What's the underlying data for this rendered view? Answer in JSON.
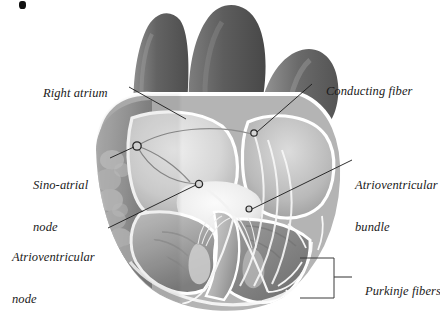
{
  "figure": {
    "kind": "anatomical-illustration",
    "style": "grayscale-shaded-drawing",
    "background": "#ffffff",
    "width": 440,
    "height": 322
  },
  "palette": {
    "background": "#ffffff",
    "vessel_dark": "#6e6e6e",
    "vessel_darker": "#5a5a5a",
    "myocardium_mid": "#9a9a9a",
    "myocardium_light": "#c3c3c3",
    "chamber_pale": "#e2e2e2",
    "valve_white": "#f4f4f4",
    "outline": "#ffffff",
    "leader_line": "#1a1a1a",
    "text": "#1a1a1a",
    "bracket": "#3a3a3a"
  },
  "labels": [
    {
      "id": "right-atrium",
      "text": "Right atrium",
      "lines": [
        "Right atrium"
      ],
      "x": 30,
      "y": 72,
      "align": "left",
      "leader": {
        "from": [
          129,
          87
        ],
        "to": [
          185,
          118
        ],
        "marker": "none"
      }
    },
    {
      "id": "sino-atrial-node",
      "text": "Sino-atrial node",
      "lines": [
        "Sino-atrial",
        "node"
      ],
      "x": 33,
      "y": 150,
      "align": "left",
      "leader": {
        "from": [
          110,
          158
        ],
        "to": [
          137,
          146
        ],
        "marker": "circle"
      }
    },
    {
      "id": "atrioventricular-node",
      "text": "Atrioventricular node",
      "lines": [
        "Atrioventricular",
        "node"
      ],
      "x": 12,
      "y": 222,
      "align": "left",
      "leader": {
        "from": [
          108,
          228
        ],
        "to": [
          199,
          184
        ],
        "marker": "circle"
      }
    },
    {
      "id": "conducting-fiber",
      "text": "Conducting fiber",
      "lines": [
        "Conducting fiber"
      ],
      "x": 313,
      "y": 70,
      "align": "left",
      "leader": {
        "from": [
          312,
          84
        ],
        "to": [
          254,
          133
        ],
        "marker": "circle"
      }
    },
    {
      "id": "atrioventricular-bundle",
      "text": "Atrioventricular bundle",
      "lines": [
        "Atrioventricular",
        "bundle"
      ],
      "x": 355,
      "y": 150,
      "align": "left",
      "leader": {
        "from": [
          352,
          160
        ],
        "to": [
          249,
          209
        ],
        "marker": "circle"
      }
    },
    {
      "id": "purkinje-fibers",
      "text": "Purkinje fibers",
      "lines": [
        "Purkinje fibers"
      ],
      "x": 352,
      "y": 270,
      "align": "left",
      "leader": {
        "from": [
          352,
          277
        ],
        "to": [
          334,
          277
        ],
        "marker": "none"
      },
      "bracket": {
        "x": 300,
        "y": 258,
        "width": 34,
        "height": 40
      }
    }
  ],
  "anatomy_parts": [
    {
      "id": "superior-vena-cava",
      "name": "Superior vena cava"
    },
    {
      "id": "aorta",
      "name": "Aorta"
    },
    {
      "id": "pulmonary-artery",
      "name": "Pulmonary artery"
    },
    {
      "id": "right-atrium-chamber",
      "name": "Right atrium"
    },
    {
      "id": "left-atrium-chamber",
      "name": "Left atrium"
    },
    {
      "id": "right-ventricle-chamber",
      "name": "Right ventricle"
    },
    {
      "id": "left-ventricle-chamber",
      "name": "Left ventricle"
    },
    {
      "id": "interventricular-septum",
      "name": "Interventricular septum"
    },
    {
      "id": "sa-node-marker",
      "name": "Sino-atrial node"
    },
    {
      "id": "av-node-marker",
      "name": "Atrioventricular node"
    },
    {
      "id": "av-bundle-path",
      "name": "Atrioventricular bundle"
    },
    {
      "id": "purkinje-network",
      "name": "Purkinje fibers"
    },
    {
      "id": "trabeculae",
      "name": "Trabeculae carneae"
    },
    {
      "id": "papillary-muscles",
      "name": "Papillary muscles"
    },
    {
      "id": "chordae-tendineae",
      "name": "Chordae tendineae"
    }
  ],
  "artifacts": [
    {
      "id": "scan-mark",
      "name": "scan speck",
      "x": 19,
      "y": 1
    }
  ]
}
